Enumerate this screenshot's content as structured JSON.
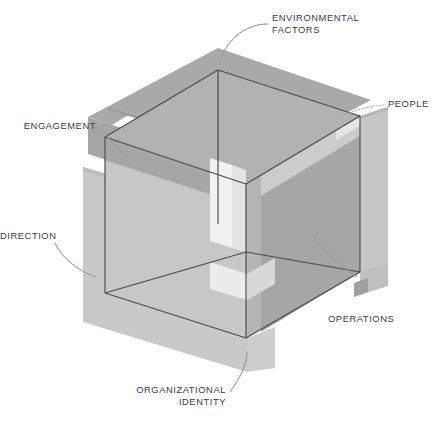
{
  "diagram": {
    "type": "isometric-cube-planes",
    "background": "#fefefe",
    "stroke_color": "#4a4a4c",
    "text_color": "#3d3d3f",
    "leader_color": "#9a9a9d",
    "palette": {
      "plane_top": "#a9a9a9",
      "plane_top_inner": "#b4b4b4",
      "plane_right_dark": "#9d9d9d",
      "plane_right_light": "#bcbcbc",
      "plane_left_light": "#c9c9c9",
      "plane_left_mid": "#bdbdbd",
      "band_light": "#d9d9d9",
      "band_pale": "#eaeaea",
      "highlight": "#f3f3f3",
      "face_front_left": "#cfcfcf",
      "face_front_right": "#b9b9b9",
      "face_top": "#b0b0b0"
    },
    "labels": [
      {
        "id": "environmental-factors",
        "text": "ENVIRONMENTAL\nFACTORS",
        "align": "left",
        "x": 272,
        "y": 18,
        "anchor_x": 218,
        "anchor_y": 66
      },
      {
        "id": "people",
        "text": "PEOPLE",
        "align": "left",
        "x": 388,
        "y": 100,
        "anchor_x": 344,
        "anchor_y": 118
      },
      {
        "id": "engagement",
        "text": "ENGAGEMENT",
        "align": "right",
        "x": 14,
        "y": 120,
        "anchor_x": 126,
        "anchor_y": 157
      },
      {
        "id": "direction",
        "text": "DIRECTION",
        "align": "right",
        "x": 16,
        "y": 230,
        "anchor_x": 96,
        "anchor_y": 275
      },
      {
        "id": "operations",
        "text": "OPERATIONS",
        "align": "left",
        "x": 328,
        "y": 317,
        "anchor_x": 316,
        "anchor_y": 236
      },
      {
        "id": "organizational-identity",
        "text": "ORGANIZATIONAL\nIDENTITY",
        "align": "right",
        "x": 100,
        "y": 390,
        "anchor_x": 247,
        "anchor_y": 352
      }
    ]
  }
}
